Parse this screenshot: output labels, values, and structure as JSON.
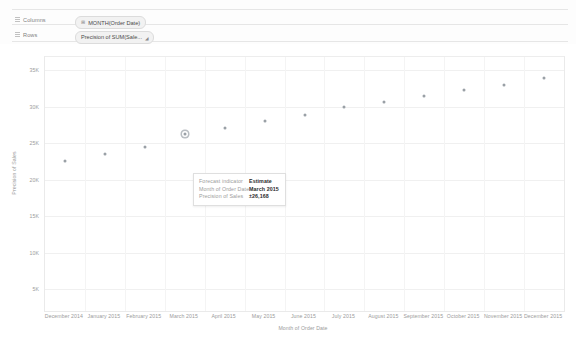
{
  "shelves": {
    "columns": {
      "label": "Columns",
      "grip_icon": "grip-icon",
      "pill": {
        "prefix": "⊞",
        "text": "MONTH(Order Date)"
      }
    },
    "rows": {
      "label": "Rows",
      "grip_icon": "grip-icon",
      "pill": {
        "text": "Precision of SUM(Sale...",
        "caret": "◢"
      }
    }
  },
  "tooltip": {
    "rows": [
      {
        "key": "Forecast indicator",
        "value": "Estimate"
      },
      {
        "key": "Month of Order Date",
        "value": "March 2015"
      },
      {
        "key": "Precision of Sales",
        "value": "±26,168"
      }
    ]
  },
  "chart_data": {
    "type": "scatter",
    "title": "",
    "xlabel": "Month of Order Date",
    "ylabel": "Precision of Sales",
    "categories": [
      "December 2014",
      "January 2015",
      "February 2015",
      "March 2015",
      "April 2015",
      "May 2015",
      "June 2015",
      "July 2015",
      "August 2015",
      "September 2015",
      "October 2015",
      "November 2015",
      "December 2015"
    ],
    "values": [
      22500,
      23500,
      24500,
      26168,
      27000,
      28000,
      28800,
      29900,
      30600,
      31400,
      32300,
      33000,
      33900
    ],
    "ylim": [
      0,
      35000
    ],
    "yticks": [
      35000,
      30000,
      25000,
      20000,
      15000,
      10000,
      5000
    ],
    "ytick_labels": [
      "35K",
      "30K",
      "25K",
      "20K",
      "15K",
      "10K",
      "5K"
    ],
    "grid": true,
    "legend": "none",
    "selected_index": 3,
    "point_color": "#9aa0a6"
  }
}
